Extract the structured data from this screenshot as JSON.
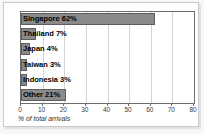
{
  "chart_data": {
    "type": "bar",
    "orientation": "horizontal",
    "title": "",
    "subtitle": "",
    "xlabel": "% of total arrivals",
    "ylabel": "",
    "categories": [
      "Singapore",
      "Thailand",
      "Japan",
      "Taiwan",
      "Indonesia",
      "Other"
    ],
    "values": [
      62,
      7,
      4,
      3,
      3,
      21
    ],
    "data_labels": [
      "Singapore 62%",
      "Thailand 7%",
      "Japan 4%",
      "Taiwan 3%",
      "Indonesia 3%",
      "Other 21%"
    ],
    "xlim": [
      0,
      80
    ],
    "ylim": [
      0,
      6
    ],
    "xticks": [
      0,
      10,
      20,
      30,
      40,
      50,
      60,
      70,
      80
    ],
    "xtick_labels": [
      "0",
      "10",
      "20",
      "30",
      "40",
      "50",
      "60",
      "70",
      "80"
    ],
    "grid": true,
    "grid_axis": "x",
    "legend": false,
    "legend_position": "none",
    "bar_color": "#8a8a8a",
    "bar_edge_color": "#5e5e5e",
    "plot_background": "#ffffff",
    "grid_color": "#d4d4d4",
    "axis_color": "#6d6d6d",
    "label_color": "#000000",
    "figure_background": "#f7f7f7"
  }
}
